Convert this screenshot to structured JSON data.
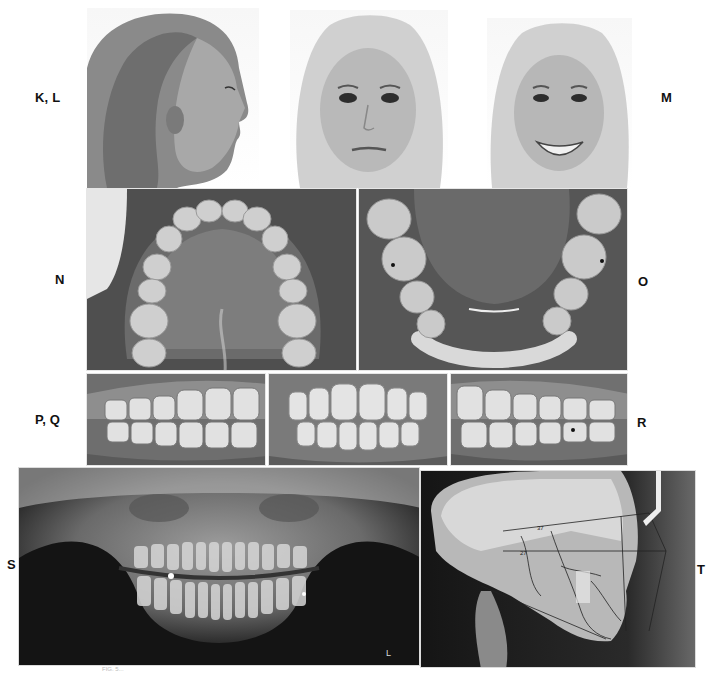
{
  "figure": {
    "panel_labels": {
      "top_left": "K, L",
      "top_right": "M",
      "mid_left": "N",
      "mid_right": "O",
      "lower_left": "P, Q",
      "lower_right": "R",
      "bottom_left": "S",
      "bottom_right": "T"
    },
    "panels": [
      {
        "id": "K-L",
        "description": "Extraoral profile photograph (right side)"
      },
      {
        "id": "K-L-frontal",
        "description": "Extraoral frontal photograph at rest"
      },
      {
        "id": "M",
        "description": "Extraoral frontal smiling photograph"
      },
      {
        "id": "N",
        "description": "Maxillary occlusal intraoral photograph"
      },
      {
        "id": "O",
        "description": "Mandibular occlusal intraoral photograph"
      },
      {
        "id": "P-Q",
        "description": "Right buccal intraoral photograph"
      },
      {
        "id": "P-Q-frontal",
        "description": "Frontal intraoral photograph in occlusion"
      },
      {
        "id": "R",
        "description": "Left buccal intraoral photograph"
      },
      {
        "id": "S",
        "description": "Panoramic radiograph"
      },
      {
        "id": "T",
        "description": "Lateral cephalometric radiograph with tracing"
      }
    ],
    "xray_marker": "L",
    "ceph_annotations": [
      "37",
      "27"
    ],
    "caption": "FIG. 5..."
  },
  "colors": {
    "background": "#ffffff",
    "label": "#111111",
    "xray_dark": "#1a1a1a",
    "tracing": "#2a2a2a"
  }
}
